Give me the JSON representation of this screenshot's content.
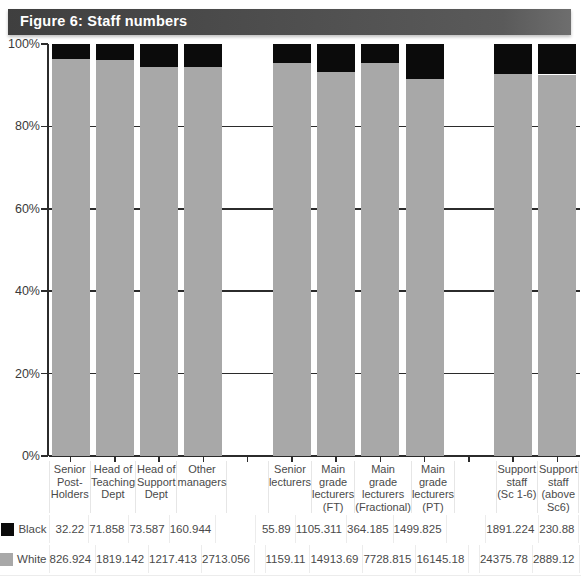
{
  "figure": {
    "title": "Figure 6: Staff numbers",
    "title_bar_color": "#4d4d4d",
    "title_text_color": "#ffffff"
  },
  "legend": {
    "black": {
      "label": "Black",
      "color": "#0b0b0b",
      "swatch": "black-swatch-icon"
    },
    "white": {
      "label": "White",
      "color": "#a8a8a8",
      "swatch": "white-swatch-icon"
    }
  },
  "chart_data": {
    "type": "bar",
    "title": "Figure 6: Staff numbers",
    "xlabel": "",
    "ylabel": "",
    "ylim": [
      0,
      100
    ],
    "stacked": true,
    "normalized_percent": true,
    "grid": true,
    "legend_position": "bottom-left-table",
    "yticks": [
      "0%",
      "20%",
      "40%",
      "60%",
      "80%",
      "100%"
    ],
    "ytick_values": [
      0,
      20,
      40,
      60,
      80,
      100
    ],
    "categories": [
      "Senior Post-Holders",
      "Head of Teaching Dept",
      "Head of Support Dept",
      "Other managers",
      "",
      "Senior lecturers",
      "Main grade lecturers (FT)",
      "Main grade lecturers (Fractional)",
      "Main grade lecturers (PT)",
      "",
      "Support staff (Sc 1-6)",
      "Support staff (above Sc6)"
    ],
    "category_lines": [
      [
        "Senior",
        "Post-",
        "Holders"
      ],
      [
        "Head of",
        "Teaching",
        "Dept"
      ],
      [
        "Head of",
        "Support",
        "Dept"
      ],
      [
        "Other",
        "managers"
      ],
      [],
      [
        "Senior",
        "lecturers"
      ],
      [
        "Main",
        "grade",
        "lecturers",
        "(FT)"
      ],
      [
        "Main",
        "grade",
        "lecturers",
        "(Fractional)"
      ],
      [
        "Main",
        "grade",
        "lecturers",
        "(PT)"
      ],
      [],
      [
        "Support",
        "staff",
        "(Sc 1-6)"
      ],
      [
        "Support",
        "staff",
        "(above",
        "Sc6)"
      ]
    ],
    "series": [
      {
        "name": "Black",
        "color": "#0b0b0b",
        "values": [
          32.22,
          71.858,
          73.587,
          160.944,
          null,
          55.89,
          1105.311,
          364.185,
          1499.825,
          null,
          1891.224,
          230.88
        ],
        "value_labels": [
          "32.22",
          "71.858",
          "73.587",
          "160.944",
          "",
          "55.89",
          "1105.311",
          "364.185",
          "1499.825",
          "",
          "1891.224",
          "230.88"
        ],
        "percent": [
          3.75,
          3.8,
          5.7,
          5.6,
          null,
          4.6,
          6.9,
          4.5,
          8.5,
          null,
          7.2,
          7.4
        ]
      },
      {
        "name": "White",
        "color": "#a8a8a8",
        "values": [
          826.924,
          1819.142,
          1217.413,
          2713.056,
          null,
          1159.11,
          14913.69,
          7728.815,
          16145.18,
          null,
          24375.78,
          2889.12
        ],
        "value_labels": [
          "826.924",
          "1819.142",
          "1217.413",
          "2713.056",
          "",
          "1159.11",
          "14913.69",
          "7728.815",
          "16145.18",
          "",
          "24375.78",
          "2889.12"
        ],
        "percent": [
          96.25,
          96.2,
          94.3,
          94.4,
          null,
          95.4,
          93.1,
          95.5,
          91.5,
          null,
          92.8,
          92.6
        ]
      }
    ]
  }
}
